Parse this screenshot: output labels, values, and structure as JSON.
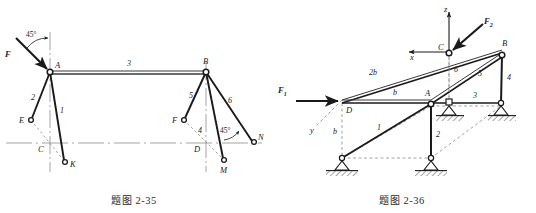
{
  "page": {
    "background": "#ffffff",
    "ink": "#1a1a1a",
    "gray": "#9a9a9a",
    "dash": "#8c8c8c"
  },
  "figures": [
    {
      "id": "fig-2-35",
      "caption_cn": "题图",
      "caption_num": "2-35",
      "type": "planar-truss",
      "description": "Planar truss with joints A and B, horizontal member 3, inclined two-force members 1,2 at A and 4,5,6 at B, loaded by force F at 45 degrees.",
      "joints": [
        {
          "name": "A",
          "x": 50,
          "y": 72,
          "style": "open-circle"
        },
        {
          "name": "B",
          "x": 206,
          "y": 72,
          "style": "open-circle"
        },
        {
          "name": "E",
          "x": 31,
          "y": 120,
          "style": "open-circle"
        },
        {
          "name": "K",
          "x": 65,
          "y": 162,
          "style": "open-circle"
        },
        {
          "name": "F",
          "x": 184,
          "y": 120,
          "style": "open-circle"
        },
        {
          "name": "M",
          "x": 224,
          "y": 160,
          "style": "open-circle"
        },
        {
          "name": "N",
          "x": 254,
          "y": 142,
          "style": "open-circle"
        },
        {
          "name": "C",
          "x": 50,
          "y": 143,
          "style": "tick-label"
        },
        {
          "name": "D",
          "x": 206,
          "y": 143,
          "style": "tick-label"
        }
      ],
      "members": [
        {
          "label": "1",
          "from": "A",
          "to": "K"
        },
        {
          "label": "2",
          "from": "A",
          "to": "E"
        },
        {
          "label": "3",
          "from": "A",
          "to": "B"
        },
        {
          "label": "4",
          "from": "B",
          "to": "M"
        },
        {
          "label": "5",
          "from": "B",
          "to": "F"
        },
        {
          "label": "6",
          "from": "B",
          "to": "N"
        }
      ],
      "forces": [
        {
          "label": "F",
          "at": "A",
          "angle_label": "45°",
          "direction": "down-right"
        }
      ],
      "angles": [
        {
          "label": "45°",
          "at": "A",
          "between": "F and vertical"
        },
        {
          "label": "45°",
          "at": "N",
          "between": "member 6 and horizontal"
        }
      ],
      "member_numbers": [
        "1",
        "2",
        "3",
        "4",
        "5",
        "6"
      ],
      "point_labels": [
        "A",
        "B",
        "C",
        "D",
        "E",
        "F",
        "K",
        "M",
        "N"
      ]
    },
    {
      "id": "fig-2-36",
      "caption_cn": "题图",
      "caption_num": "2-36",
      "type": "space-truss",
      "description": "Space truss in oblique projection with axes x, y, z at C, loaded by F1 at D and F2 at C, six members numbered 1 to 6, three pinned ground supports.",
      "axes": [
        {
          "label": "z",
          "direction": "up"
        },
        {
          "label": "x",
          "direction": "left"
        },
        {
          "label": "y",
          "direction": "down-left"
        }
      ],
      "joints": [
        {
          "name": "C",
          "style": "open-circle"
        },
        {
          "name": "B",
          "style": "open-circle"
        },
        {
          "name": "A",
          "style": "open-circle"
        },
        {
          "name": "D",
          "style": "corner"
        }
      ],
      "dimensions": [
        {
          "label": "2b",
          "on": "D to C"
        },
        {
          "label": "b",
          "on": "D to A"
        },
        {
          "label": "b",
          "on": "D vertical drop"
        }
      ],
      "forces": [
        {
          "label": "F",
          "sub": "1",
          "at": "D",
          "direction": "horizontal-right"
        },
        {
          "label": "F",
          "sub": "2",
          "at": "C",
          "direction": "down-left"
        }
      ],
      "member_numbers": [
        "1",
        "2",
        "3",
        "4",
        "5",
        "6"
      ],
      "point_labels": [
        "A",
        "B",
        "C",
        "D"
      ],
      "supports": {
        "count": 3,
        "type": "pinned-hatched"
      }
    }
  ]
}
